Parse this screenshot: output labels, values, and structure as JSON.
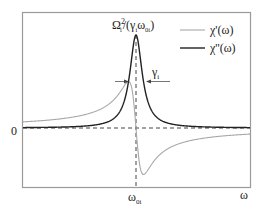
{
  "chart_data": {
    "type": "line",
    "title": "",
    "xlabel": "ω",
    "ylabel": "",
    "x_tick_labels": [
      {
        "label": "ω",
        "sub": "0i",
        "position": "center"
      }
    ],
    "y_tick_labels": [
      {
        "label": "0",
        "position": "zero-line"
      }
    ],
    "grid": false,
    "legend_position": "upper-right",
    "series": [
      {
        "name": "χ'(ω)",
        "label_main": "χ'(ω)",
        "color": "#a8a8a8",
        "shape": "dispersive Lorentzian (real part): positive below ω0i, negative above ω0i, extrema at ω0i ∓ γi with magnitude half the peak of χ''"
      },
      {
        "name": "χ''(ω)",
        "label_main": "χ''(ω)",
        "color": "#222222",
        "shape": "absorptive Lorentzian (imaginary part): peak at ω0i"
      }
    ],
    "annotations": {
      "peak_label": {
        "main": "Ω",
        "sup": "2",
        "sub": "i",
        "rest_open": "/(γ",
        "rest_sub": "i",
        "rest_mid": "ω",
        "rest_sub2": "0i",
        "rest_close": ")"
      },
      "width_label": {
        "main": "γ",
        "sub": "i"
      },
      "peak_value_relative": 1.0,
      "chi_prime_extreme_relative": 0.5,
      "center": "ω0i"
    },
    "model": {
      "center_px": 136,
      "zero_y_px": 128,
      "peak_height_px": 93,
      "hwhm_px": 7.5
    }
  },
  "labels": {
    "zero": "0",
    "x_axis": "ω",
    "center_main": "ω",
    "center_sub": "0i",
    "gamma_main": "γ",
    "gamma_sub": "i",
    "peak_omega": "Ω",
    "peak_sup": "2",
    "peak_sub": "i",
    "peak_open": "/(γ",
    "peak_sub2": "i",
    "peak_omega2": "ω",
    "peak_sub3": "0i",
    "peak_close": ")",
    "legend_prime": "χ'(ω)",
    "legend_dprime": "χ''(ω)"
  },
  "colors": {
    "frame": "#9a9a9a",
    "chi_prime": "#a8a8a8",
    "chi_double_prime": "#222222",
    "dash": "#444444",
    "text": "#222222"
  }
}
